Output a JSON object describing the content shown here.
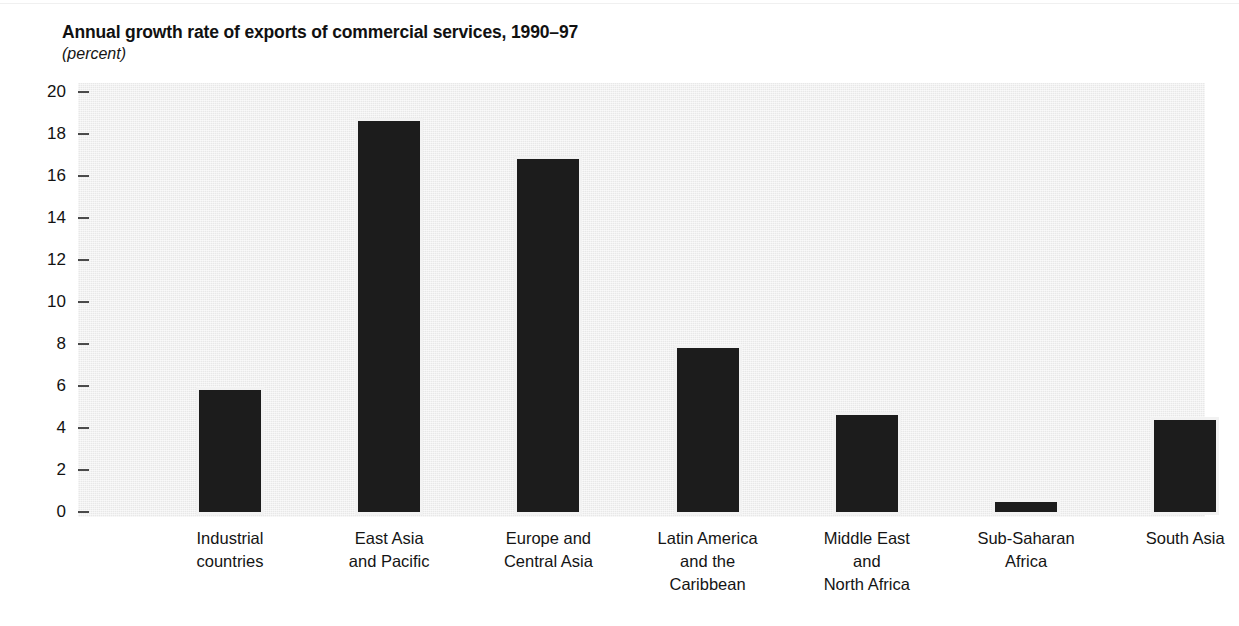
{
  "chart_data": {
    "type": "bar",
    "title": "Annual growth rate of exports of commercial services, 1990–97",
    "subtitle": "(percent)",
    "xlabel": "",
    "ylabel": "",
    "unit": "percent",
    "ylim": [
      0,
      20
    ],
    "ytick_step": 2,
    "ytick_labels": [
      "20",
      "18",
      "16",
      "14",
      "12",
      "10",
      "8",
      "6",
      "4",
      "2",
      "0"
    ],
    "grid": false,
    "legend": null,
    "orientation": "vertical",
    "bar_color": "#1c1c1c",
    "plot_background": "#e8e8e8",
    "categories": [
      "Industrial countries",
      "East Asia and Pacific",
      "Europe and Central Asia",
      "Latin America and the Caribbean",
      "Middle East and North Africa",
      "Sub-Saharan Africa",
      "South Asia"
    ],
    "category_lines": [
      [
        "Industrial",
        "countries"
      ],
      [
        "East Asia",
        "and Pacific"
      ],
      [
        "Europe and",
        "Central Asia"
      ],
      [
        "Latin America",
        "and the",
        "Caribbean"
      ],
      [
        "Middle East",
        "and",
        "North Africa"
      ],
      [
        "Sub-Saharan",
        "Africa"
      ],
      [
        "South Asia"
      ]
    ],
    "values": [
      5.8,
      18.6,
      16.8,
      7.8,
      4.6,
      0.5,
      4.4
    ]
  }
}
